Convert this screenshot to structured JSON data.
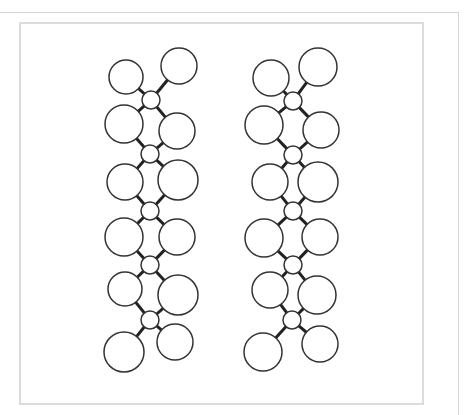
{
  "figure": {
    "stroke_color": "#333333",
    "connector_color": "#222222",
    "frame_color": "#dcdcdc",
    "outer_line_color": "#d6d6d6",
    "circle_stroke_width": 1.5,
    "connector_stroke_width": 3
  },
  "chains": [
    {
      "name": "left-chain",
      "nodes": [
        {
          "cx": 151,
          "cy": 100,
          "r": 9
        },
        {
          "cx": 150,
          "cy": 154,
          "r": 9
        },
        {
          "cx": 150,
          "cy": 211,
          "r": 9
        },
        {
          "cx": 150,
          "cy": 265,
          "r": 9
        },
        {
          "cx": 150,
          "cy": 320,
          "r": 9
        }
      ],
      "circles": [
        {
          "cx": 126,
          "cy": 77,
          "r": 17,
          "node": 0
        },
        {
          "cx": 179,
          "cy": 66,
          "r": 18,
          "node": 0
        },
        {
          "cx": 124,
          "cy": 124,
          "r": 19,
          "node": [
            0,
            1
          ]
        },
        {
          "cx": 177,
          "cy": 131,
          "r": 18,
          "node": [
            0,
            1
          ]
        },
        {
          "cx": 125,
          "cy": 182,
          "r": 18,
          "node": [
            1,
            2
          ]
        },
        {
          "cx": 178,
          "cy": 180,
          "r": 20,
          "node": [
            1,
            2
          ]
        },
        {
          "cx": 124,
          "cy": 237,
          "r": 19,
          "node": [
            2,
            3
          ]
        },
        {
          "cx": 177,
          "cy": 237,
          "r": 18,
          "node": [
            2,
            3
          ]
        },
        {
          "cx": 125,
          "cy": 289,
          "r": 17,
          "node": [
            3,
            4
          ]
        },
        {
          "cx": 178,
          "cy": 295,
          "r": 20,
          "node": [
            3,
            4
          ]
        },
        {
          "cx": 124,
          "cy": 352,
          "r": 20,
          "node": 4
        },
        {
          "cx": 175,
          "cy": 342,
          "r": 18,
          "node": 4
        }
      ]
    },
    {
      "name": "right-chain",
      "nodes": [
        {
          "cx": 293,
          "cy": 101,
          "r": 9
        },
        {
          "cx": 293,
          "cy": 155,
          "r": 9
        },
        {
          "cx": 293,
          "cy": 211,
          "r": 9
        },
        {
          "cx": 293,
          "cy": 265,
          "r": 9
        },
        {
          "cx": 292,
          "cy": 320,
          "r": 9
        }
      ],
      "circles": [
        {
          "cx": 271,
          "cy": 78,
          "r": 18,
          "node": 0
        },
        {
          "cx": 318,
          "cy": 67,
          "r": 19,
          "node": 0
        },
        {
          "cx": 264,
          "cy": 125,
          "r": 19,
          "node": [
            0,
            1
          ]
        },
        {
          "cx": 321,
          "cy": 130,
          "r": 18,
          "node": [
            0,
            1
          ]
        },
        {
          "cx": 270,
          "cy": 182,
          "r": 18,
          "node": [
            1,
            2
          ]
        },
        {
          "cx": 318,
          "cy": 182,
          "r": 20,
          "node": [
            1,
            2
          ]
        },
        {
          "cx": 264,
          "cy": 238,
          "r": 19,
          "node": [
            2,
            3
          ]
        },
        {
          "cx": 320,
          "cy": 237,
          "r": 18,
          "node": [
            2,
            3
          ]
        },
        {
          "cx": 270,
          "cy": 290,
          "r": 18,
          "node": [
            3,
            4
          ]
        },
        {
          "cx": 317,
          "cy": 295,
          "r": 19,
          "node": [
            3,
            4
          ]
        },
        {
          "cx": 263,
          "cy": 352,
          "r": 19,
          "node": 4
        },
        {
          "cx": 320,
          "cy": 344,
          "r": 18,
          "node": 4
        }
      ]
    }
  ]
}
